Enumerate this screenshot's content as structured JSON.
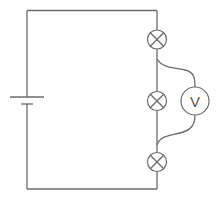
{
  "diagram": {
    "colors": {
      "wire": "#6b6b6b",
      "background": "#ffffff",
      "label": "#555555"
    },
    "components": [
      {
        "type": "battery",
        "name": "cell",
        "position": "left side"
      },
      {
        "type": "lamp",
        "name": "lamp-1",
        "position": "top right"
      },
      {
        "type": "lamp",
        "name": "lamp-2",
        "position": "middle right"
      },
      {
        "type": "lamp",
        "name": "lamp-3",
        "position": "bottom right"
      },
      {
        "type": "voltmeter",
        "name": "voltmeter",
        "label": "V",
        "connected_across": "lamp-2"
      }
    ],
    "voltmeter_label": "V"
  }
}
